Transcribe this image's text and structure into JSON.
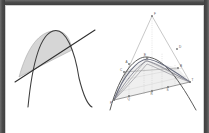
{
  "panel": {
    "title": "Two geometric figures",
    "background_color": "#ffffff",
    "frame_color": "#4a4a4a",
    "inner_edge_color": "#cfcfcf"
  },
  "figures": [
    {
      "id": "parabola-secant-figure",
      "name": "Parabola with secant line and shaded segment",
      "caption": "",
      "curve_color": "#3c3c3c",
      "line_color": "#2f2f2f",
      "shade_color": "#d6d6d6",
      "shade_stroke": "#8f8f8f",
      "elements": [
        {
          "name": "parabola-curve",
          "label": ""
        },
        {
          "name": "secant-line",
          "label": ""
        },
        {
          "name": "shaded-segment",
          "label": ""
        }
      ]
    },
    {
      "id": "parabola-construction-figure",
      "name": "Nested parabolic arcs with inscribed triangle and grid",
      "caption": "",
      "curve_color": "#4a4a4a",
      "accent_curve_color": "#6b6f80",
      "guide_color": "#9a9a9a",
      "grid_color": "#c8c8c8",
      "fill_color": "#ededed",
      "point_color": "#707070",
      "point_labels": [
        {
          "name": "apex-point",
          "label": "F"
        },
        {
          "name": "summit-point",
          "label": "E"
        },
        {
          "name": "upper-right-point",
          "label": "D"
        },
        {
          "name": "upper-left-point",
          "label": "C"
        },
        {
          "name": "right-vertex-point",
          "label": "B"
        },
        {
          "name": "left-vertex-point",
          "label": "A"
        },
        {
          "name": "base-left-point",
          "label": "P"
        },
        {
          "name": "base-mid-left-point",
          "label": "Q"
        },
        {
          "name": "base-mid-point",
          "label": "R"
        },
        {
          "name": "base-mid-right-point",
          "label": "S"
        },
        {
          "name": "base-right-point",
          "label": "T"
        }
      ]
    }
  ]
}
